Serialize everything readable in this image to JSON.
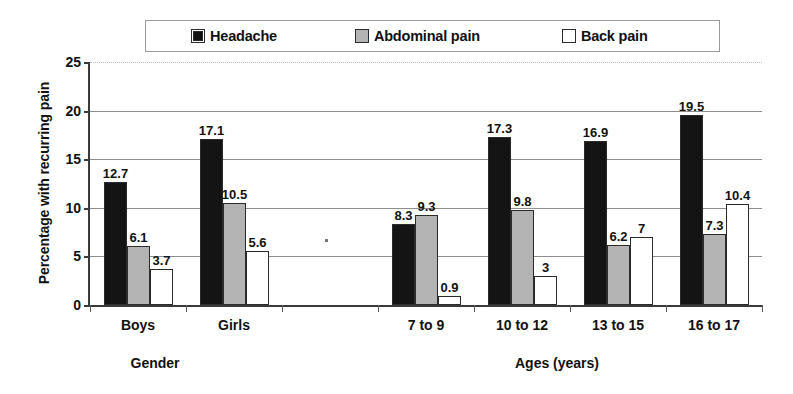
{
  "legend": {
    "position": "top",
    "entries": [
      {
        "label": "Headache",
        "swatch": "black-square-icon",
        "color": "#141414"
      },
      {
        "label": "Abdominal pain",
        "swatch": "gray-square-icon",
        "color": "#b4b4b4"
      },
      {
        "label": "Back pain",
        "swatch": "white-square-icon",
        "color": "#ffffff"
      }
    ]
  },
  "axes": {
    "y_title": "Percentage with recurring pain",
    "y_ticks": [
      "0",
      "5",
      "10",
      "15",
      "20",
      "25"
    ]
  },
  "sections": [
    {
      "label": "Gender"
    },
    {
      "label": "Ages (years)"
    }
  ],
  "chart_data": {
    "type": "bar",
    "title": "",
    "xlabel": "",
    "ylabel": "Percentage with recurring pain",
    "ylim": [
      0,
      25
    ],
    "yticks": [
      0,
      5,
      10,
      15,
      20,
      25
    ],
    "grid": true,
    "legend_position": "top",
    "categories": [
      "Boys",
      "Girls",
      "",
      "7 to 9",
      "10 to 12",
      "13 to 15",
      "16 to 17"
    ],
    "series": [
      {
        "name": "Headache",
        "color": "#141414",
        "values": [
          12.7,
          17.1,
          null,
          8.3,
          17.3,
          16.9,
          19.5
        ],
        "labels": [
          "12.7",
          "17.1",
          "",
          "8.3",
          "17.3",
          "16.9",
          "19.5"
        ]
      },
      {
        "name": "Abdominal pain",
        "color": "#b4b4b4",
        "values": [
          6.1,
          10.5,
          null,
          9.3,
          9.8,
          6.2,
          7.3
        ],
        "labels": [
          "6.1",
          "10.5",
          "",
          "9.3",
          "9.8",
          "6.2",
          "7.3"
        ]
      },
      {
        "name": "Back pain",
        "color": "#ffffff",
        "values": [
          3.7,
          5.6,
          null,
          0.9,
          3,
          7,
          10.4
        ],
        "labels": [
          "3.7",
          "5.6",
          "",
          "0.9",
          "3",
          "7",
          "10.4"
        ]
      }
    ]
  }
}
